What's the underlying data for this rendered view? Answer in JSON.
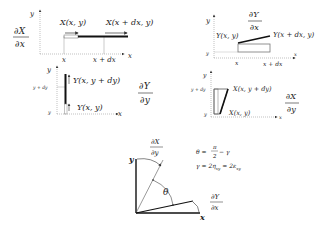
{
  "panels": {
    "dX_dx": {
      "fraction": {
        "num": "∂X",
        "den": "∂x"
      },
      "axis_y": "y",
      "axis_x": "x",
      "label_left": "X(x, y)",
      "label_right": "X(x + dx, y)",
      "tick_x1": "x",
      "tick_x2": "x + dx"
    },
    "dY_dy": {
      "fraction": {
        "num": "∂Y",
        "den": "∂y"
      },
      "axis_y": "y",
      "axis_x": "x",
      "label_top": "Y(x, y + dy)",
      "label_bottom": "Y(x, y)",
      "tick_y1": "y",
      "tick_y2": "y + dy"
    },
    "dY_dx": {
      "fraction": {
        "num": "∂Y",
        "den": "∂x"
      },
      "axis_y": "y",
      "axis_x": "x",
      "label_left": "Y(x, y)",
      "label_right": "Y(x + dx, y)",
      "tick_y": "y",
      "tick_x1": "x",
      "tick_x2": "x + dx"
    },
    "dX_dy": {
      "fraction": {
        "num": "∂X",
        "den": "∂y"
      },
      "axis_y": "y",
      "axis_x": "x",
      "label_top": "X(x, y + dy)",
      "label_bottom": "X(x, y)",
      "tick_y1": "y",
      "tick_y2": "y + dy"
    },
    "shear": {
      "axis_y": "y",
      "axis_x": "x",
      "fraction_top": {
        "num": "∂X",
        "den": "∂y"
      },
      "fraction_right": {
        "num": "∂Y",
        "den": "∂x"
      },
      "angle_label": "θ",
      "eq1": {
        "lhs": "θ =",
        "num": "π",
        "den": "2",
        "rhs": "− γ"
      },
      "eq2": "γ = 2η",
      "eq2_sub": "xy",
      "eq2_mid": " = 2ε",
      "eq2_sub2": "xy"
    }
  }
}
